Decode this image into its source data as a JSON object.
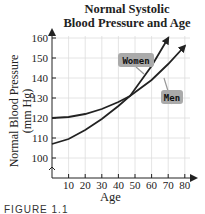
{
  "chart_data": {
    "type": "line",
    "title_lines": [
      "Normal Systolic",
      "Blood Pressure and Age"
    ],
    "xlabel": "Age",
    "ylabel": "Normal Blood Pressure (mm Hg)",
    "ylabel_lines": [
      "Normal Blood Pressure",
      "(mm Hg)"
    ],
    "xticks": [
      10,
      20,
      30,
      40,
      50,
      60,
      70,
      80
    ],
    "yticks": [
      100,
      110,
      120,
      130,
      140,
      150,
      160
    ],
    "xlim": [
      0,
      80
    ],
    "ylim": [
      95,
      163
    ],
    "grid": true,
    "series": [
      {
        "name": "Men",
        "x": [
          0,
          10,
          20,
          30,
          40,
          47,
          60,
          70,
          80
        ],
        "values": [
          120,
          120.5,
          122,
          124.5,
          128,
          131,
          139,
          147,
          156
        ]
      },
      {
        "name": "Women",
        "x": [
          0,
          10,
          20,
          30,
          40,
          47,
          60,
          70
        ],
        "values": [
          107,
          109.5,
          114,
          119.5,
          126,
          131,
          146,
          160
        ]
      }
    ],
    "annotations": [
      "Women",
      "Men"
    ],
    "caption": "FIGURE 1.1"
  }
}
